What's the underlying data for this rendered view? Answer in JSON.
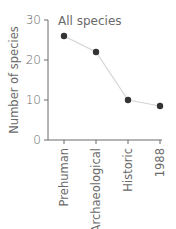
{
  "chart_data": {
    "type": "line",
    "title": "All species",
    "xlabel": "",
    "ylabel": "Number of species",
    "categories": [
      "Prehuman",
      "Archaeological",
      "Historic",
      "1988"
    ],
    "values": [
      26,
      22,
      10,
      8.5
    ],
    "ylim": [
      0,
      30
    ],
    "yticks": [
      0,
      10,
      20,
      30
    ],
    "grid": false,
    "legend": null,
    "colors": {
      "line": "#d4d4d4",
      "marker": "#333333",
      "axis": "#6a6a6a",
      "text": "#6a6a6a"
    }
  }
}
